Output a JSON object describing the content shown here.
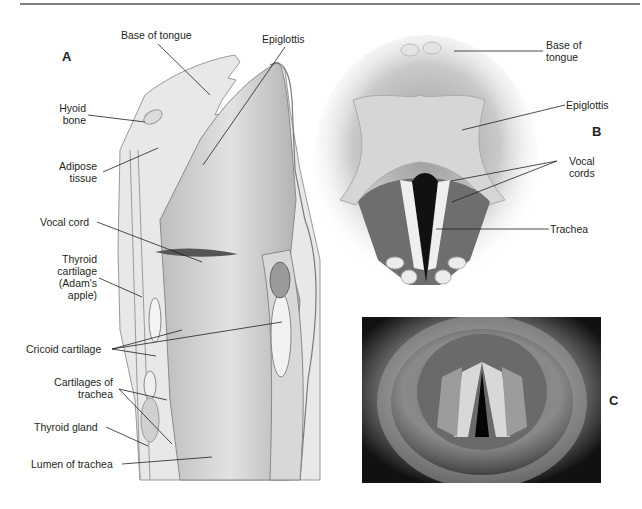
{
  "figure": {
    "panels": {
      "a": "A",
      "b": "B",
      "c": "C"
    },
    "panel_a": {
      "title": "Sagittal section of larynx",
      "labels": {
        "base_of_tongue": "Base of tongue",
        "epiglottis": "Epiglottis",
        "hyoid_bone_1": "Hyoid",
        "hyoid_bone_2": "bone",
        "adipose_1": "Adipose",
        "adipose_2": "tissue",
        "vocal_cord": "Vocal cord",
        "thyroid_cart_1": "Thyroid",
        "thyroid_cart_2": "cartilage",
        "thyroid_cart_3": "(Adam's",
        "thyroid_cart_4": "apple)",
        "cricoid": "Cricoid cartilage",
        "cart_trachea_1": "Cartilages of",
        "cart_trachea_2": "trachea",
        "thyroid_gland": "Thyroid gland",
        "lumen": "Lumen of trachea"
      }
    },
    "panel_b": {
      "title": "Superior view of larynx",
      "labels": {
        "base_of_tongue_1": "Base of",
        "base_of_tongue_2": "tongue",
        "epiglottis": "Epiglottis",
        "vocal_cords_1": "Vocal",
        "vocal_cords_2": "cords",
        "trachea": "Trachea"
      }
    },
    "panel_c": {
      "title": "Laryngoscopic photograph of vocal cords"
    }
  },
  "colors": {
    "text": "#231f20",
    "line": "#231f20",
    "rule": "#808080"
  }
}
